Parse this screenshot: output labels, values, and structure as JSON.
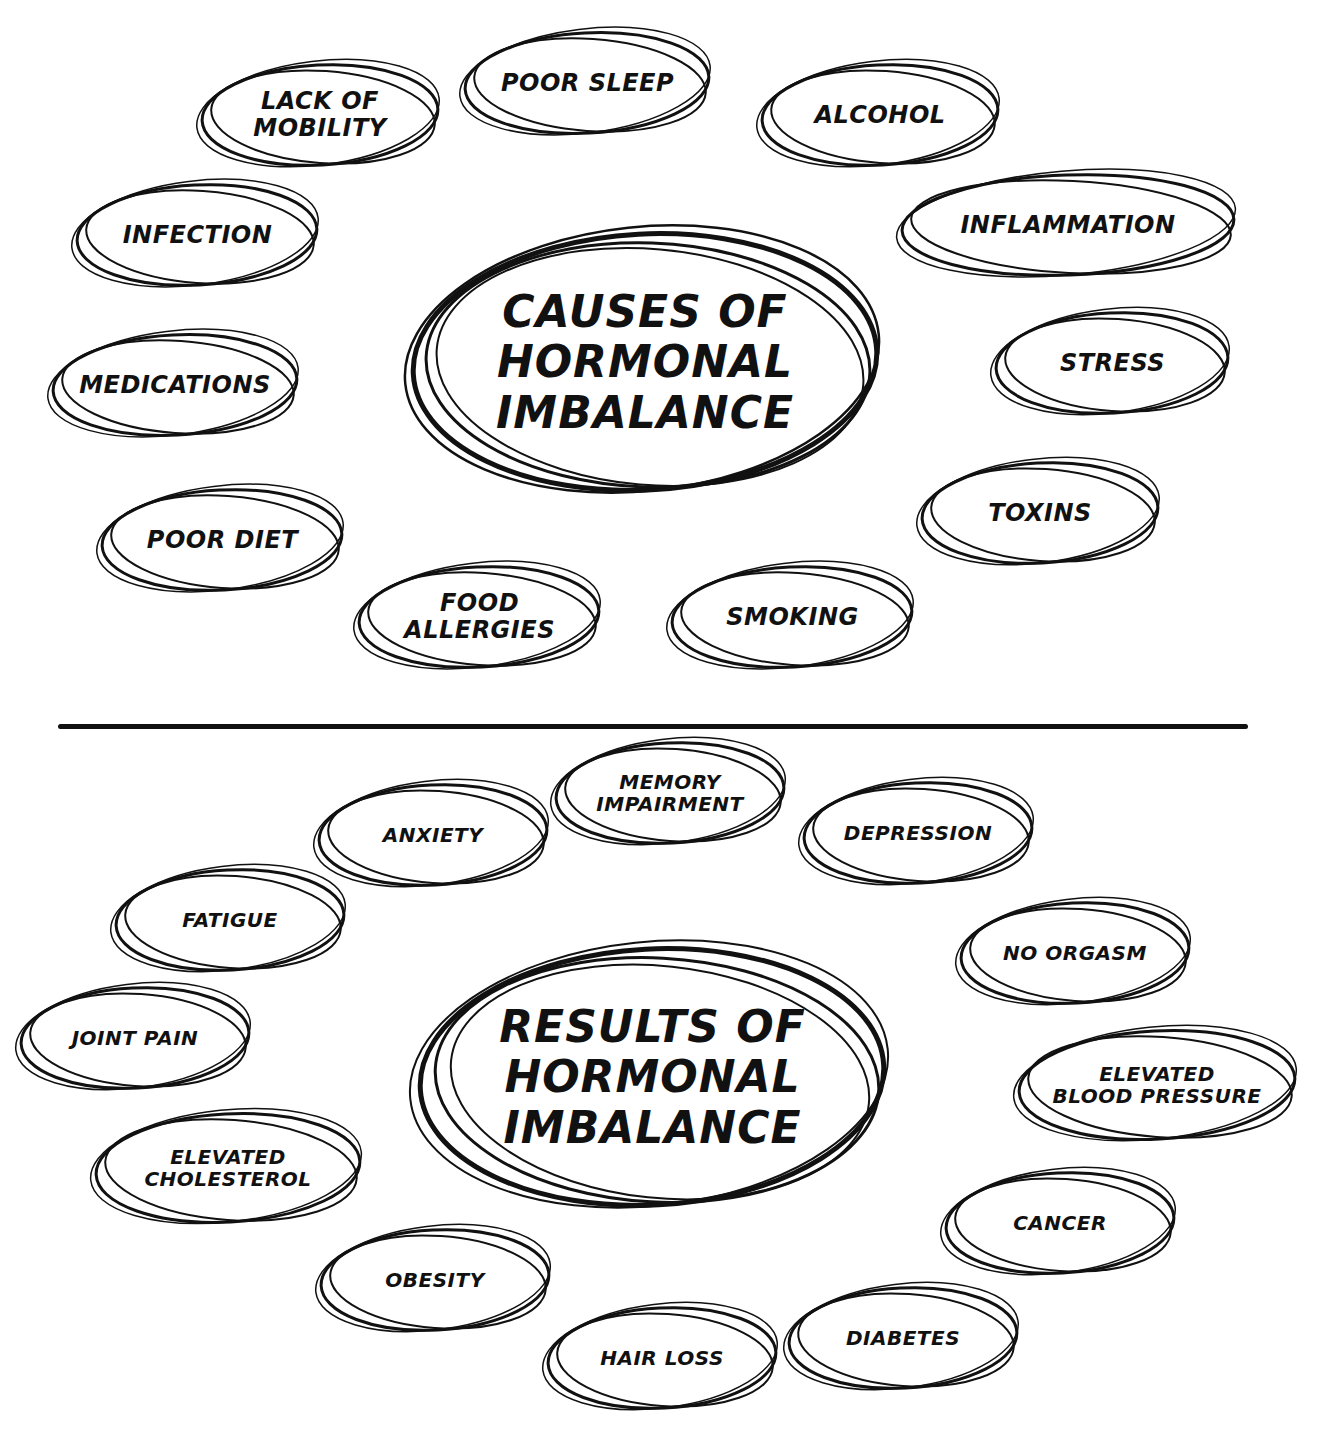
{
  "diagram": {
    "causes": {
      "title": "Causes of\nHormonal\nImbalance",
      "items": [
        {
          "label": "Poor Sleep"
        },
        {
          "label": "Lack of\nMobility"
        },
        {
          "label": "Alcohol"
        },
        {
          "label": "Infection"
        },
        {
          "label": "Inflammation"
        },
        {
          "label": "Medications"
        },
        {
          "label": "Stress"
        },
        {
          "label": "Poor Diet"
        },
        {
          "label": "Toxins"
        },
        {
          "label": "Food\nAllergies"
        },
        {
          "label": "Smoking"
        }
      ]
    },
    "results": {
      "title": "Results of\nHormonal\nImbalance",
      "items": [
        {
          "label": "Memory\nImpairment"
        },
        {
          "label": "Anxiety"
        },
        {
          "label": "Depression"
        },
        {
          "label": "Fatigue"
        },
        {
          "label": "No Orgasm"
        },
        {
          "label": "Joint Pain"
        },
        {
          "label": "Elevated\nBlood Pressure"
        },
        {
          "label": "Elevated\nCholesterol"
        },
        {
          "label": "Cancer"
        },
        {
          "label": "Obesity"
        },
        {
          "label": "Hair Loss"
        },
        {
          "label": "Diabetes"
        }
      ]
    },
    "colors": {
      "ink": "#111111",
      "background": "#ffffff"
    }
  }
}
